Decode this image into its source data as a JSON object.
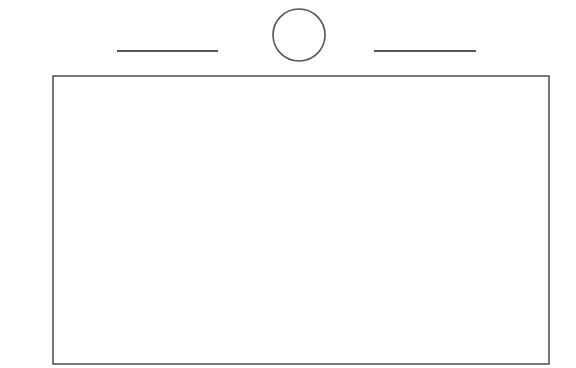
{
  "canvas": {
    "width": 576,
    "height": 368,
    "background": "#ffffff",
    "stroke": "#555555"
  },
  "diagram": {
    "shapes": [
      {
        "id": "left-line",
        "type": "line",
        "x1": 117,
        "y1": 51,
        "x2": 218,
        "y2": 51,
        "stroke_width": 2
      },
      {
        "id": "center-circle",
        "type": "circle",
        "cx": 299,
        "cy": 35,
        "r": 26,
        "stroke_width": 1.6
      },
      {
        "id": "right-line",
        "type": "line",
        "x1": 374,
        "y1": 51,
        "x2": 476,
        "y2": 51,
        "stroke_width": 2
      },
      {
        "id": "main-rectangle",
        "type": "rect",
        "x": 53,
        "y": 76,
        "width": 496,
        "height": 288,
        "stroke_width": 1.6
      }
    ]
  }
}
